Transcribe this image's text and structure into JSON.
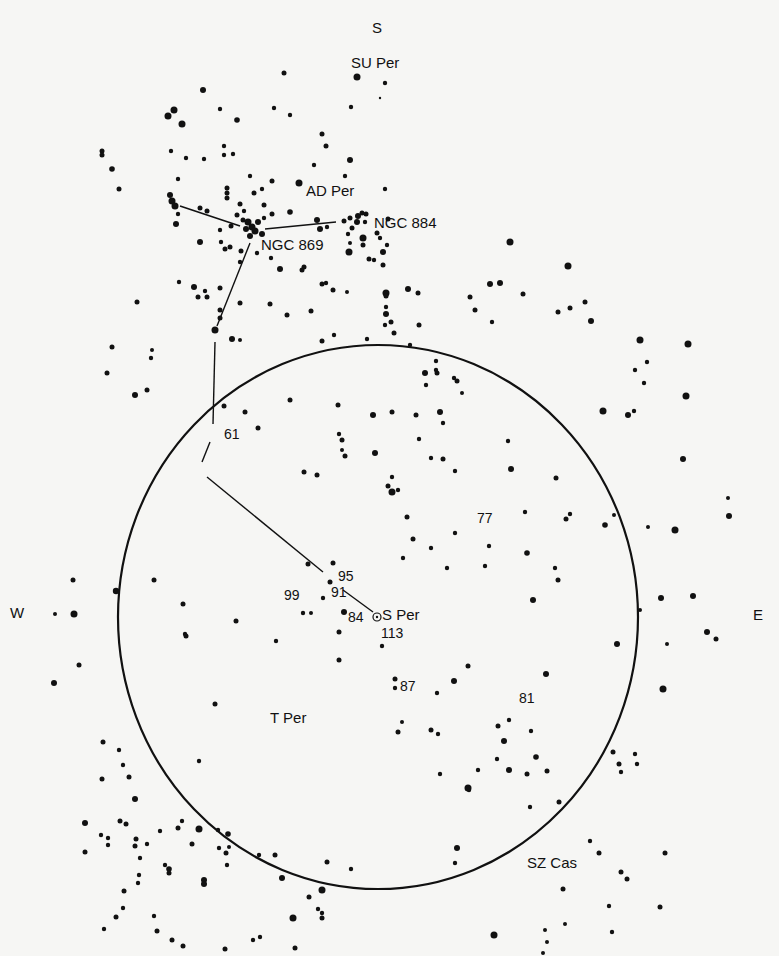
{
  "figure": {
    "ink_color": "#111111",
    "paper_color": "#f6f6f4"
  },
  "compass": {
    "north_top": {
      "label": "S",
      "x": 372,
      "y": 33
    },
    "west": {
      "label": "W",
      "x": 10,
      "y": 618
    },
    "east": {
      "label": "E",
      "x": 753,
      "y": 620
    }
  },
  "field_circle": {
    "cx": 378,
    "cy": 617,
    "rx": 260,
    "ry": 272
  },
  "labels": [
    {
      "id": "su-per",
      "text": "SU Per",
      "x": 351,
      "y": 68,
      "cls": "name"
    },
    {
      "id": "ad-per",
      "text": "AD Per",
      "x": 306,
      "y": 196,
      "cls": "name"
    },
    {
      "id": "ngc-884",
      "text": "NGC 884",
      "x": 374,
      "y": 228,
      "cls": "name"
    },
    {
      "id": "ngc-869",
      "text": "NGC 869",
      "x": 261,
      "y": 250,
      "cls": "name"
    },
    {
      "id": "star-61",
      "text": "61",
      "x": 224,
      "y": 439,
      "cls": "num"
    },
    {
      "id": "star-77",
      "text": "77",
      "x": 477,
      "y": 523,
      "cls": "num"
    },
    {
      "id": "star-95",
      "text": "95",
      "x": 338,
      "y": 581,
      "cls": "num"
    },
    {
      "id": "star-91",
      "text": "91",
      "x": 331,
      "y": 597,
      "cls": "num"
    },
    {
      "id": "star-99",
      "text": "99",
      "x": 284,
      "y": 600,
      "cls": "num"
    },
    {
      "id": "star-84",
      "text": "84",
      "x": 348,
      "y": 622,
      "cls": "num"
    },
    {
      "id": "s-per",
      "text": "S Per",
      "x": 382,
      "y": 620,
      "cls": "name"
    },
    {
      "id": "star-113",
      "text": "113",
      "x": 381,
      "y": 638,
      "cls": "num"
    },
    {
      "id": "star-87",
      "text": "87",
      "x": 400,
      "y": 691,
      "cls": "num"
    },
    {
      "id": "star-81",
      "text": "81",
      "x": 519,
      "y": 703,
      "cls": "num"
    },
    {
      "id": "t-per",
      "text": "T Per",
      "x": 270,
      "y": 723,
      "cls": "name"
    },
    {
      "id": "sz-cas",
      "text": "SZ Cas",
      "x": 527,
      "y": 868,
      "cls": "name"
    }
  ],
  "lines": [
    {
      "x1": 180,
      "y1": 206,
      "x2": 240,
      "y2": 226
    },
    {
      "x1": 265,
      "y1": 229,
      "x2": 336,
      "y2": 222
    },
    {
      "x1": 250,
      "y1": 243,
      "x2": 217,
      "y2": 326
    },
    {
      "x1": 215,
      "y1": 342,
      "x2": 213,
      "y2": 424
    },
    {
      "x1": 210,
      "y1": 442,
      "x2": 202,
      "y2": 462
    },
    {
      "x1": 207,
      "y1": 477,
      "x2": 323,
      "y2": 572
    },
    {
      "x1": 343,
      "y1": 590,
      "x2": 373,
      "y2": 612
    }
  ],
  "variable_marker": {
    "x": 377,
    "y": 617,
    "r": 4
  },
  "stars": [
    [
      350,
      243,
      2
    ],
    [
      284,
      73,
      2.5
    ],
    [
      357,
      77,
      3.5
    ],
    [
      385,
      83,
      2.2
    ],
    [
      203,
      90,
      3
    ],
    [
      168,
      116,
      3.5
    ],
    [
      174,
      110,
      3.5
    ],
    [
      182,
      124,
      3.5
    ],
    [
      220,
      109,
      2.2
    ],
    [
      237,
      120,
      2.8
    ],
    [
      290,
      115,
      2.2
    ],
    [
      274,
      108,
      2.2
    ],
    [
      351,
      107,
      2.2
    ],
    [
      322,
      134,
      2.5
    ],
    [
      326,
      146,
      2.5
    ],
    [
      350,
      160,
      3
    ],
    [
      314,
      165,
      2.2
    ],
    [
      380,
      98,
      1.2
    ],
    [
      102,
      151,
      2.5
    ],
    [
      102,
      155,
      2.5
    ],
    [
      112,
      169,
      2.8
    ],
    [
      119,
      189,
      2.5
    ],
    [
      171,
      151,
      2.2
    ],
    [
      186,
      158,
      2.2
    ],
    [
      204,
      159,
      2.2
    ],
    [
      224,
      146,
      2.2
    ],
    [
      224,
      155,
      2.2
    ],
    [
      233,
      154,
      2.2
    ],
    [
      250,
      176,
      2.2
    ],
    [
      272,
      181,
      2.5
    ],
    [
      299,
      183,
      3.5
    ],
    [
      178,
      179,
      2.2
    ],
    [
      170,
      195,
      3
    ],
    [
      172,
      201,
      3.5
    ],
    [
      175,
      206,
      3.5
    ],
    [
      227,
      188,
      2.5
    ],
    [
      227,
      193,
      2.5
    ],
    [
      227,
      198,
      2.5
    ],
    [
      254,
      193,
      2.5
    ],
    [
      262,
      189,
      2.2
    ],
    [
      345,
      176,
      2.2
    ],
    [
      385,
      189,
      2.2
    ],
    [
      290,
      212,
      2.8
    ],
    [
      264,
      205,
      2.5
    ],
    [
      272,
      214,
      2.5
    ],
    [
      240,
      204,
      2.5
    ],
    [
      244,
      211,
      2.2
    ],
    [
      237,
      215,
      2.5
    ],
    [
      243,
      220,
      2.5
    ],
    [
      248,
      222,
      3.5
    ],
    [
      252,
      227,
      3.5
    ],
    [
      255,
      231,
      3.5
    ],
    [
      246,
      229,
      3
    ],
    [
      258,
      222,
      3
    ],
    [
      262,
      234,
      3
    ],
    [
      250,
      236,
      3
    ],
    [
      264,
      218,
      2.2
    ],
    [
      178,
      214,
      2.2
    ],
    [
      176,
      224,
      3
    ],
    [
      200,
      208,
      2.5
    ],
    [
      207,
      211,
      2.5
    ],
    [
      231,
      226,
      2.5
    ],
    [
      220,
      230,
      2.2
    ],
    [
      200,
      242,
      3
    ],
    [
      221,
      242,
      2.2
    ],
    [
      230,
      247,
      2.5
    ],
    [
      225,
      249,
      2.5
    ],
    [
      241,
      251,
      2.5
    ],
    [
      257,
      253,
      2.2
    ],
    [
      240,
      262,
      2.2
    ],
    [
      271,
      258,
      2.2
    ],
    [
      280,
      269,
      3
    ],
    [
      304,
      267,
      2.5
    ],
    [
      317,
      220,
      3
    ],
    [
      320,
      229,
      3
    ],
    [
      327,
      227,
      2.2
    ],
    [
      344,
      221,
      2.5
    ],
    [
      350,
      218,
      2.5
    ],
    [
      357,
      222,
      3
    ],
    [
      358,
      216,
      3
    ],
    [
      362,
      213,
      2.5
    ],
    [
      366,
      214,
      2.5
    ],
    [
      352,
      228,
      2.5
    ],
    [
      348,
      234,
      2.2
    ],
    [
      349,
      252,
      3.5
    ],
    [
      363,
      245,
      2.5
    ],
    [
      369,
      259,
      2.5
    ],
    [
      374,
      260,
      2.2
    ],
    [
      383,
      252,
      3
    ],
    [
      380,
      238,
      2.2
    ],
    [
      387,
      245,
      2.2
    ],
    [
      383,
      265,
      2.5
    ],
    [
      363,
      238,
      3.5
    ],
    [
      365,
      222,
      2.2
    ],
    [
      388,
      219,
      2.5
    ],
    [
      377,
      233,
      2.5
    ],
    [
      302,
      270,
      2.5
    ],
    [
      179,
      282,
      2.2
    ],
    [
      194,
      287,
      3
    ],
    [
      205,
      291,
      2.2
    ],
    [
      220,
      288,
      2.5
    ],
    [
      322,
      284,
      2.5
    ],
    [
      326,
      283,
      2.2
    ],
    [
      347,
      292,
      2
    ],
    [
      386,
      293,
      3.5
    ],
    [
      198,
      297,
      2.5
    ],
    [
      207,
      297,
      2.5
    ],
    [
      240,
      303,
      2.5
    ],
    [
      220,
      310,
      2.5
    ],
    [
      220,
      318,
      2.5
    ],
    [
      215,
      330,
      3.5
    ],
    [
      232,
      339,
      3
    ],
    [
      240,
      340,
      2
    ],
    [
      137,
      302,
      2.5
    ],
    [
      112,
      347,
      2.5
    ],
    [
      152,
      350,
      2
    ],
    [
      151,
      358,
      2.2
    ],
    [
      107,
      373,
      2.5
    ],
    [
      135,
      395,
      3
    ],
    [
      147,
      390,
      2.5
    ],
    [
      270,
      304,
      2.5
    ],
    [
      287,
      315,
      2.5
    ],
    [
      311,
      311,
      2.5
    ],
    [
      333,
      290,
      2.5
    ],
    [
      385,
      293,
      2.2
    ],
    [
      322,
      341,
      2.5
    ],
    [
      334,
      335,
      2.2
    ],
    [
      367,
      339,
      2.2
    ],
    [
      386,
      314,
      3
    ],
    [
      391,
      322,
      2.5
    ],
    [
      408,
      289,
      3
    ],
    [
      418,
      293,
      2.5
    ],
    [
      386,
      296,
      2.5
    ],
    [
      386,
      307,
      2.2
    ],
    [
      394,
      333,
      2.5
    ],
    [
      410,
      345,
      2.2
    ],
    [
      385,
      325,
      2.2
    ],
    [
      437,
      373,
      2.5
    ],
    [
      454,
      378,
      2.2
    ],
    [
      426,
      385,
      2.2
    ],
    [
      457,
      381,
      2.5
    ],
    [
      470,
      297,
      2.5
    ],
    [
      475,
      310,
      2.5
    ],
    [
      490,
      284,
      3
    ],
    [
      492,
      322,
      2.2
    ],
    [
      500,
      283,
      3
    ],
    [
      510,
      242,
      3.5
    ],
    [
      523,
      294,
      2.5
    ],
    [
      568,
      266,
      3.5
    ],
    [
      558,
      312,
      2.5
    ],
    [
      570,
      308,
      2.5
    ],
    [
      585,
      302,
      2.5
    ],
    [
      591,
      321,
      3
    ],
    [
      640,
      340,
      3.5
    ],
    [
      635,
      370,
      2.2
    ],
    [
      647,
      362,
      2.2
    ],
    [
      644,
      383,
      2.2
    ],
    [
      603,
      411,
      3.5
    ],
    [
      688,
      344,
      3.5
    ],
    [
      686,
      396,
      3.5
    ],
    [
      628,
      415,
      3
    ],
    [
      634,
      411,
      2.2
    ],
    [
      605,
      525,
      2.8
    ],
    [
      683,
      459,
      3
    ],
    [
      729,
      516,
      3
    ],
    [
      675,
      530,
      3.5
    ],
    [
      728,
      498,
      2
    ],
    [
      224,
      406,
      2.5
    ],
    [
      290,
      400,
      2.5
    ],
    [
      245,
      412,
      2.5
    ],
    [
      258,
      428,
      2.5
    ],
    [
      304,
      472,
      2.5
    ],
    [
      342,
      440,
      2.5
    ],
    [
      345,
      456,
      2.5
    ],
    [
      338,
      405,
      2.5
    ],
    [
      339,
      434,
      2.2
    ],
    [
      419,
      325,
      2.5
    ],
    [
      436,
      361,
      2.2
    ],
    [
      425,
      373,
      3
    ],
    [
      416,
      415,
      2.5
    ],
    [
      436,
      370,
      2.2
    ],
    [
      443,
      423,
      2.2
    ],
    [
      455,
      471,
      2.2
    ],
    [
      462,
      393,
      2
    ],
    [
      375,
      453,
      3
    ],
    [
      388,
      486,
      2.5
    ],
    [
      392,
      477,
      2.2
    ],
    [
      342,
      450,
      2
    ],
    [
      398,
      490,
      2.2
    ],
    [
      407,
      517,
      2.5
    ],
    [
      413,
      539,
      2.5
    ],
    [
      403,
      558,
      2.2
    ],
    [
      443,
      459,
      2.5
    ],
    [
      440,
      412,
      3
    ],
    [
      373,
      415,
      3
    ],
    [
      317,
      475,
      2.5
    ],
    [
      392,
      412,
      2.5
    ],
    [
      392,
      492,
      3.5
    ],
    [
      419,
      439,
      2.2
    ],
    [
      431,
      458,
      2.2
    ],
    [
      431,
      548,
      2.2
    ],
    [
      447,
      568,
      2.2
    ],
    [
      455,
      533,
      2.2
    ],
    [
      489,
      546,
      2.2
    ],
    [
      508,
      441,
      2.2
    ],
    [
      511,
      469,
      3
    ],
    [
      533,
      600,
      3
    ],
    [
      527,
      553,
      2.8
    ],
    [
      485,
      566,
      2.2
    ],
    [
      556,
      478,
      2.5
    ],
    [
      566,
      519,
      2.5
    ],
    [
      570,
      514,
      2.2
    ],
    [
      558,
      580,
      2.5
    ],
    [
      525,
      512,
      2.2
    ],
    [
      555,
      568,
      2.2
    ],
    [
      614,
      515,
      2
    ],
    [
      648,
      527,
      2
    ],
    [
      640,
      610,
      2
    ],
    [
      661,
      598,
      3
    ],
    [
      617,
      644,
      3
    ],
    [
      667,
      644,
      2
    ],
    [
      613,
      752,
      2.5
    ],
    [
      619,
      764,
      2.5
    ],
    [
      621,
      772,
      2.2
    ],
    [
      454,
      681,
      3
    ],
    [
      468,
      666,
      2.5
    ],
    [
      437,
      693,
      2.2
    ],
    [
      431,
      730,
      2.5
    ],
    [
      438,
      734,
      2.2
    ],
    [
      469,
      790,
      2.2
    ],
    [
      440,
      774,
      2.2
    ],
    [
      478,
      770,
      2.2
    ],
    [
      509,
      770,
      3
    ],
    [
      527,
      774,
      2.5
    ],
    [
      547,
      771,
      2.5
    ],
    [
      546,
      674,
      3
    ],
    [
      509,
      720,
      2.2
    ],
    [
      531,
      731,
      2.2
    ],
    [
      457,
      848,
      3
    ],
    [
      455,
      863,
      2.2
    ],
    [
      530,
      807,
      2.2
    ],
    [
      559,
      802,
      2.5
    ],
    [
      468,
      788,
      3.5
    ],
    [
      498,
      726,
      2.5
    ],
    [
      504,
      741,
      3
    ],
    [
      536,
      757,
      2.8
    ],
    [
      599,
      853,
      2.5
    ],
    [
      497,
      759,
      2.2
    ],
    [
      590,
      841,
      2.2
    ],
    [
      563,
      889,
      2.5
    ],
    [
      693,
      596,
      3
    ],
    [
      707,
      632,
      3
    ],
    [
      716,
      639,
      2.5
    ],
    [
      663,
      689,
      3.5
    ],
    [
      635,
      754,
      2.2
    ],
    [
      637,
      764,
      2.2
    ],
    [
      665,
      853,
      2.5
    ],
    [
      621,
      872,
      2.5
    ],
    [
      627,
      879,
      2.5
    ],
    [
      609,
      906,
      2.2
    ],
    [
      660,
      907,
      2.5
    ],
    [
      545,
      930,
      2
    ],
    [
      612,
      932,
      2.2
    ],
    [
      494,
      935,
      3.5
    ],
    [
      547,
      942,
      2
    ],
    [
      565,
      924,
      2
    ],
    [
      543,
      953,
      2
    ],
    [
      308,
      564,
      2.5
    ],
    [
      333,
      563,
      2.5
    ],
    [
      330,
      582,
      2.5
    ],
    [
      323,
      598,
      2.2
    ],
    [
      344,
      612,
      3
    ],
    [
      311,
      613,
      2
    ],
    [
      303,
      613,
      2.2
    ],
    [
      339,
      632,
      2.5
    ],
    [
      276,
      641,
      2.2
    ],
    [
      339,
      660,
      2.5
    ],
    [
      382,
      646,
      2.2
    ],
    [
      395,
      679,
      2.5
    ],
    [
      395,
      688,
      2.2
    ],
    [
      398,
      732,
      2.5
    ],
    [
      402,
      722,
      2
    ],
    [
      73,
      580,
      2.5
    ],
    [
      55,
      614,
      2
    ],
    [
      74,
      614,
      3.5
    ],
    [
      116,
      591,
      3.2
    ],
    [
      79,
      665,
      2.5
    ],
    [
      54,
      683,
      3
    ],
    [
      154,
      580,
      2.5
    ],
    [
      183,
      604,
      2.5
    ],
    [
      236,
      621,
      2.5
    ],
    [
      185,
      634,
      2.2
    ],
    [
      186,
      636,
      2.5
    ],
    [
      215,
      704,
      2.5
    ],
    [
      199,
      761,
      2.2
    ],
    [
      103,
      742,
      2.5
    ],
    [
      119,
      750,
      2.2
    ],
    [
      123,
      765,
      2.2
    ],
    [
      129,
      777,
      2.5
    ],
    [
      102,
      779,
      2.5
    ],
    [
      135,
      799,
      3
    ],
    [
      126,
      824,
      2.5
    ],
    [
      101,
      835,
      2.2
    ],
    [
      108,
      838,
      2.2
    ],
    [
      135,
      846,
      2.5
    ],
    [
      147,
      844,
      2.2
    ],
    [
      160,
      831,
      2.2
    ],
    [
      178,
      828,
      2.5
    ],
    [
      182,
      821,
      2.2
    ],
    [
      199,
      829,
      3.5
    ],
    [
      218,
      830,
      2.2
    ],
    [
      228,
      834,
      2.8
    ],
    [
      219,
      848,
      2.2
    ],
    [
      226,
      853,
      2.5
    ],
    [
      85,
      852,
      2.5
    ],
    [
      108,
      845,
      2.2
    ],
    [
      124,
      891,
      2.5
    ],
    [
      139,
      875,
      2.2
    ],
    [
      138,
      883,
      2.2
    ],
    [
      165,
      865,
      2.2
    ],
    [
      169,
      869,
      2.8
    ],
    [
      169,
      873,
      2.5
    ],
    [
      259,
      855,
      2.2
    ],
    [
      282,
      878,
      3
    ],
    [
      327,
      862,
      2.5
    ],
    [
      351,
      869,
      2.2
    ],
    [
      275,
      855,
      2.5
    ],
    [
      204,
      880,
      3
    ],
    [
      204,
      884,
      3
    ],
    [
      322,
      890,
      3.5
    ],
    [
      309,
      897,
      2.5
    ],
    [
      318,
      909,
      2.2
    ],
    [
      322,
      913,
      2.2
    ],
    [
      322,
      918,
      2.5
    ],
    [
      293,
      918,
      3.5
    ],
    [
      116,
      917,
      2.5
    ],
    [
      154,
      916,
      2.2
    ],
    [
      157,
      931,
      2.5
    ],
    [
      104,
      929,
      2.2
    ],
    [
      172,
      940,
      2.5
    ],
    [
      123,
      908,
      2.2
    ],
    [
      253,
      940,
      2.2
    ],
    [
      260,
      937,
      2.2
    ],
    [
      225,
      949,
      2.5
    ],
    [
      295,
      948,
      2.5
    ],
    [
      85,
      823,
      3
    ],
    [
      227,
      865,
      2.2
    ],
    [
      136,
      839,
      2.5
    ],
    [
      120,
      821,
      2.5
    ],
    [
      140,
      858,
      2.2
    ],
    [
      192,
      844,
      2.5
    ],
    [
      229,
      847,
      2
    ],
    [
      183,
      946,
      2.5
    ]
  ]
}
